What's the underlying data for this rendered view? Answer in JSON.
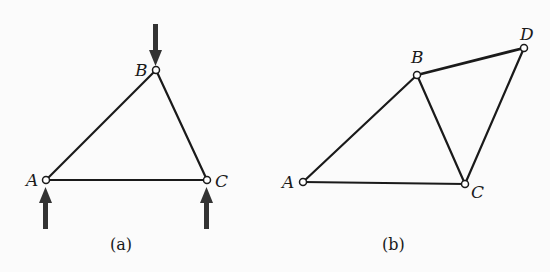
{
  "figures": [
    {
      "id": "a",
      "caption": "(a)",
      "joints": [
        {
          "name": "A",
          "label": "A",
          "x": 46,
          "y": 180
        },
        {
          "name": "B",
          "label": "B",
          "x": 156,
          "y": 70
        },
        {
          "name": "C",
          "label": "C",
          "x": 207,
          "y": 180
        }
      ],
      "members": [
        [
          "A",
          "B"
        ],
        [
          "B",
          "C"
        ],
        [
          "A",
          "C"
        ]
      ],
      "loads": [
        {
          "at": "B",
          "direction": "down"
        },
        {
          "at": "A",
          "direction": "up"
        },
        {
          "at": "C",
          "direction": "up"
        }
      ]
    },
    {
      "id": "b",
      "caption": "(b)",
      "joints": [
        {
          "name": "A",
          "label": "A",
          "x": 303,
          "y": 182
        },
        {
          "name": "B",
          "label": "B",
          "x": 417,
          "y": 75
        },
        {
          "name": "C",
          "label": "C",
          "x": 465,
          "y": 184
        },
        {
          "name": "D",
          "label": "D",
          "x": 524,
          "y": 48
        }
      ],
      "members": [
        [
          "A",
          "B"
        ],
        [
          "B",
          "C"
        ],
        [
          "A",
          "C"
        ],
        [
          "B",
          "D"
        ],
        [
          "C",
          "D"
        ]
      ],
      "loads": []
    }
  ],
  "colors": {
    "ink": "#1a1a1a",
    "arrow": "#333333",
    "background": "#fbfbfb"
  }
}
